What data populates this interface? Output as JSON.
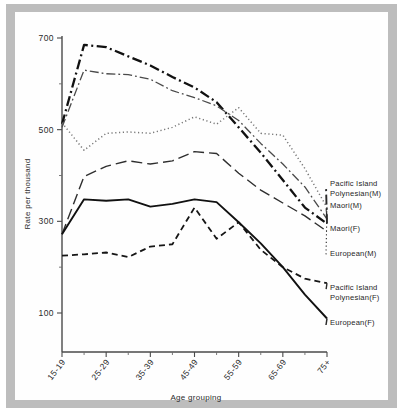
{
  "chart_data": {
    "type": "line",
    "title": "",
    "xlabel": "Age grouping",
    "ylabel": "Rate per thousand",
    "ylim": [
      0,
      700
    ],
    "ytick_labels": [
      "700",
      "500",
      "300",
      "100"
    ],
    "ytick_values": [
      700,
      500,
      300,
      100
    ],
    "grid": false,
    "legend_position": "right-inline",
    "x": [
      "15-19",
      "20-24",
      "25-29",
      "30-34",
      "35-39",
      "40-44",
      "45-49",
      "50-54",
      "55-59",
      "60-64",
      "65-69",
      "70-74",
      "75+"
    ],
    "xtick_labels": [
      "15-19",
      "25-29",
      "35-39",
      "45-49",
      "55-59",
      "65-69",
      "75+"
    ],
    "series": [
      {
        "name": "Pacific Island Polynesian(M)",
        "label_lines": [
          "Pacific Island",
          "Polynesian(M)"
        ],
        "style": "dash-dot-thick",
        "values": [
          512,
          685,
          680,
          660,
          640,
          615,
          592,
          560,
          505,
          450,
          390,
          330,
          295
        ]
      },
      {
        "name": "Maori(M)",
        "label_lines": [
          "Maori(M)"
        ],
        "style": "dash-dot-thin",
        "values": [
          505,
          630,
          622,
          620,
          610,
          585,
          570,
          552,
          520,
          470,
          425,
          375,
          305
        ]
      },
      {
        "name": "Maori(F)",
        "label_lines": [
          "Maori(F)"
        ],
        "style": "long-dash",
        "values": [
          272,
          398,
          420,
          432,
          425,
          432,
          452,
          448,
          405,
          368,
          340,
          312,
          278
        ]
      },
      {
        "name": "European(M)",
        "label_lines": [
          "European(M)"
        ],
        "style": "dotted",
        "values": [
          515,
          455,
          492,
          495,
          492,
          505,
          528,
          512,
          548,
          492,
          488,
          415,
          330
        ]
      },
      {
        "name": "Pacific Island Polynesian(F)",
        "label_lines": [
          "Pacific Island",
          "Polynesian(F)"
        ],
        "style": "short-dash",
        "values": [
          225,
          228,
          232,
          222,
          245,
          250,
          330,
          262,
          298,
          238,
          200,
          175,
          165
        ]
      },
      {
        "name": "European(F)",
        "label_lines": [
          "European(F)"
        ],
        "style": "solid",
        "values": [
          272,
          348,
          345,
          348,
          332,
          338,
          348,
          342,
          298,
          252,
          200,
          140,
          88
        ]
      }
    ]
  },
  "axes": {
    "y_title": "Rate per thousand",
    "x_title": "Age grouping"
  }
}
